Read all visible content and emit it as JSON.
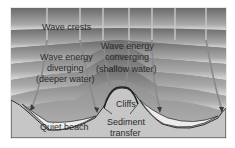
{
  "diagram": {
    "labels": {
      "wave_crests": "Wave crests",
      "diverging_1": "Wave energy",
      "diverging_2": "diverging",
      "diverging_3": "(deeper water)",
      "converging_1": "Wave energy",
      "converging_2": "converging",
      "converging_3": "(shallow water)",
      "cliffs": "Cliffs",
      "sediment_1": "Sediment",
      "sediment_2": "transfer",
      "quiet_beach": "Quiet beach"
    },
    "colors": {
      "deep_water": "#6e6e6e",
      "shallow_water": "#b9b9b9",
      "crest_light": "#d8d8d8",
      "land": "#c4c4c4",
      "beach": "#e2e2e2",
      "arrows": "#8a8a8a",
      "outline": "#3a3a3a",
      "frame": "#d9d9d9"
    }
  }
}
